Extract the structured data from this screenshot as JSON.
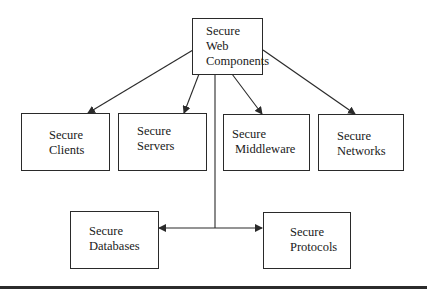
{
  "diagram": {
    "type": "hierarchy",
    "colors": {
      "stroke": "#2a2a2a",
      "background": "#ffffff",
      "text": "#1a1a1a"
    },
    "root": {
      "id": "web",
      "lines": [
        "Secure",
        "Web",
        "Components"
      ]
    },
    "nodes": [
      {
        "id": "clients",
        "lines": [
          "Secure",
          "Clients"
        ]
      },
      {
        "id": "servers",
        "lines": [
          "Secure",
          "Servers"
        ]
      },
      {
        "id": "middleware",
        "lines": [
          "Secure",
          "Middleware"
        ]
      },
      {
        "id": "networks",
        "lines": [
          "Secure",
          "Networks"
        ]
      },
      {
        "id": "databases",
        "lines": [
          "Secure",
          "Databases"
        ]
      },
      {
        "id": "protocols",
        "lines": [
          "Secure",
          "Protocols"
        ]
      }
    ],
    "edges": [
      {
        "from": "web",
        "to": "clients",
        "arrow": "end"
      },
      {
        "from": "web",
        "to": "servers",
        "arrow": "end"
      },
      {
        "from": "web",
        "to": "middleware",
        "arrow": "end"
      },
      {
        "from": "web",
        "to": "networks",
        "arrow": "end"
      },
      {
        "from": "web",
        "to": "databases",
        "arrow": "end"
      },
      {
        "from": "web",
        "to": "protocols",
        "arrow": "end"
      }
    ]
  }
}
